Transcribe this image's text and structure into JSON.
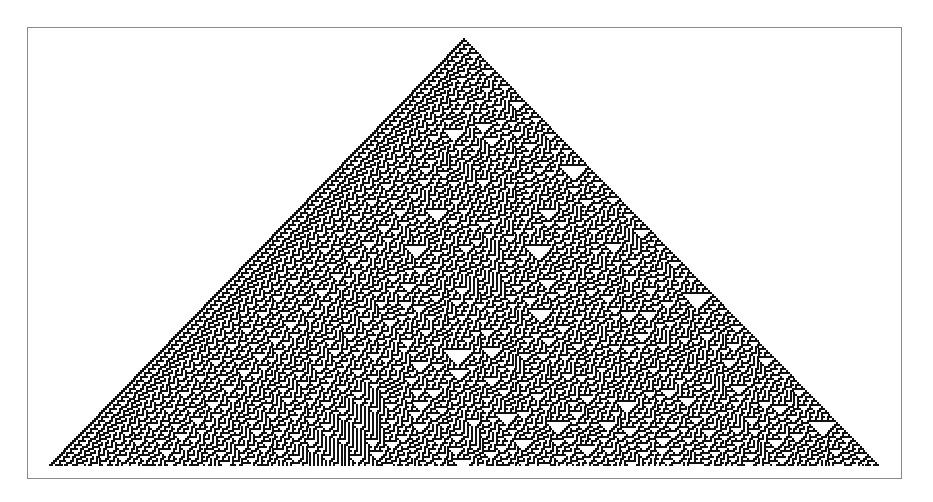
{
  "figure": {
    "rule": 30,
    "initial_condition": "single black cell",
    "colors": {
      "background": "#ffffff",
      "cell_on": "#111111",
      "frame": "#8a8a8a"
    },
    "frame": {
      "left": 27,
      "top": 27,
      "right": 902,
      "bottom": 479
    },
    "apex": {
      "x": 463,
      "y": 38
    },
    "base": {
      "y": 466,
      "left": 48,
      "right": 880
    },
    "cell_size": 2
  }
}
